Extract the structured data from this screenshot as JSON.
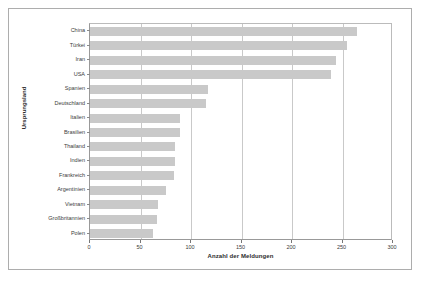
{
  "chart_data": {
    "type": "bar",
    "orientation": "horizontal",
    "title": "",
    "xlabel": "Anzahl der Meldungen",
    "ylabel": "Ursprungsland",
    "xlim": [
      0,
      300
    ],
    "xticks": [
      0,
      50,
      100,
      150,
      200,
      250,
      300
    ],
    "grid": true,
    "legend": false,
    "bar_color": "#c9c9c9",
    "categories": [
      "China",
      "Türkei",
      "Iran",
      "USA",
      "Spanien",
      "Deutschland",
      "Italien",
      "Brasilien",
      "Thailand",
      "Indien",
      "Frankreich",
      "Argentinien",
      "Vietnam",
      "Großbritannien",
      "Polen"
    ],
    "values": [
      264,
      254,
      244,
      239,
      117,
      115,
      89,
      89,
      84,
      84,
      83,
      75,
      67,
      66,
      62
    ]
  }
}
